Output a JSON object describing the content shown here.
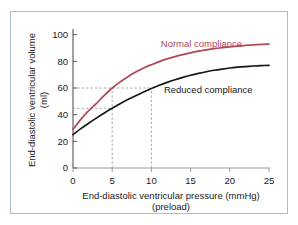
{
  "figure": {
    "frame_border_color": "#a9bcd0",
    "background_color": "#ffffff"
  },
  "chart_data": {
    "type": "line",
    "title": "",
    "xlabel": "End-diastolic ventricular pressure (mmHg)",
    "xlabel_line2": "(preload)",
    "ylabel": "End-diastolic ventricular volume",
    "ylabel_line2": "(ml)",
    "xlim": [
      0,
      25
    ],
    "ylim": [
      0,
      105
    ],
    "xticks": [
      0,
      5,
      10,
      15,
      20,
      25
    ],
    "xtick_labels": [
      "0",
      "5",
      "10",
      "15",
      "20",
      "25"
    ],
    "yticks": [
      0,
      20,
      40,
      60,
      80,
      100
    ],
    "ytick_labels": [
      "0",
      "20",
      "40",
      "60",
      "80",
      "100"
    ],
    "grid": false,
    "legend_position": "inline-annotation",
    "series": [
      {
        "name": "Normal compliance",
        "color": "#b0485a",
        "label_x": 11.2,
        "label_y": 91,
        "x": [
          0,
          1,
          2,
          3,
          4,
          5,
          6,
          7,
          8,
          9,
          10,
          11,
          12,
          13,
          14,
          15,
          16,
          17,
          18,
          19,
          20,
          21,
          22,
          23,
          24,
          25
        ],
        "y": [
          29,
          36.5,
          43,
          48.5,
          54.5,
          60,
          64.5,
          68.5,
          72,
          75,
          77.5,
          79.8,
          81.8,
          83.5,
          85,
          86.4,
          87.6,
          88.6,
          89.5,
          90.2,
          90.9,
          91.4,
          91.9,
          92.3,
          92.7,
          93
        ]
      },
      {
        "name": "Reduced compliance",
        "color": "#161616",
        "label_x": 11.6,
        "label_y": 56,
        "x": [
          0,
          1,
          2,
          3,
          4,
          5,
          6,
          7,
          8,
          9,
          10,
          11,
          12,
          13,
          14,
          15,
          16,
          17,
          18,
          19,
          20,
          21,
          22,
          23,
          24,
          25
        ],
        "y": [
          25,
          29.5,
          33.6,
          37.5,
          41.3,
          44.8,
          48.2,
          51.3,
          54.2,
          57.0,
          59.6,
          62.0,
          64.2,
          66.2,
          68.0,
          69.6,
          71.0,
          72.2,
          73.3,
          74.2,
          75.0,
          75.6,
          76.1,
          76.5,
          76.8,
          77.0
        ]
      }
    ],
    "annotations": [
      {
        "name": "guide-volume-60",
        "type": "horizontal-dashed",
        "y": 60,
        "x_from": 0,
        "x_to": 10,
        "color": "#9a9a9a"
      },
      {
        "name": "guide-volume-45",
        "type": "horizontal-dashed",
        "y": 44.8,
        "x_from": 0,
        "x_to": 5,
        "color": "#9a9a9a"
      },
      {
        "name": "guide-pressure-5",
        "type": "vertical-dashed",
        "x": 5,
        "y_from": 0,
        "y_to": 60,
        "color": "#9a9a9a"
      },
      {
        "name": "guide-pressure-10",
        "type": "vertical-dashed",
        "x": 10,
        "y_from": 0,
        "y_to": 60,
        "color": "#9a9a9a"
      }
    ],
    "axis_color_x": "#9a9a9a",
    "axis_color_y": "#555555"
  }
}
